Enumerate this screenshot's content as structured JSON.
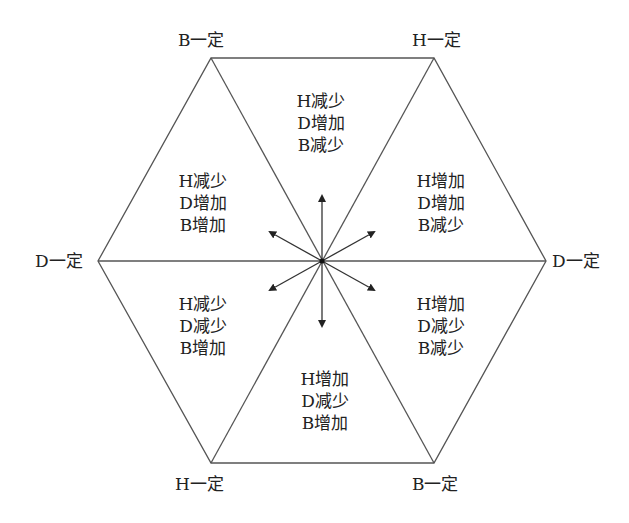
{
  "diagram": {
    "type": "hexagon-phase-diagram",
    "colors": {
      "line": "#555555",
      "arrow": "#222222",
      "text": "#222222",
      "background": "#ffffff"
    },
    "vertex_labels": {
      "top_left": "B一定",
      "top_right": "H一定",
      "left": "D一定",
      "right": "D一定",
      "bottom_left": "H一定",
      "bottom_right": "B一定"
    },
    "regions": {
      "top": [
        "H减少",
        "D增加",
        "B减少"
      ],
      "upper_left": [
        "H减少",
        "D增加",
        "B增加"
      ],
      "upper_right": [
        "H增加",
        "D增加",
        "B减少"
      ],
      "lower_left": [
        "H减少",
        "D减少",
        "B增加"
      ],
      "lower_right": [
        "H增加",
        "D减少",
        "B减少"
      ],
      "bottom": [
        "H增加",
        "D减少",
        "B增加"
      ]
    },
    "arrows": [
      "up",
      "down",
      "upper-left",
      "upper-right",
      "lower-left",
      "lower-right"
    ]
  }
}
